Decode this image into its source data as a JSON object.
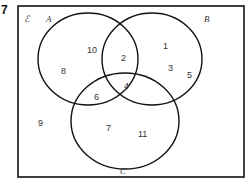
{
  "question_number": "7",
  "universal_label": "ℰ",
  "sets": {
    "A": {
      "label": "A"
    },
    "B": {
      "label": "B"
    },
    "C": {
      "label": "C"
    }
  },
  "regions": {
    "A_only": [
      "10",
      "8"
    ],
    "B_only": [
      "1",
      "3",
      "5"
    ],
    "C_only": [
      "7",
      "11"
    ],
    "A_and_B_only": [
      "2"
    ],
    "A_and_C_only": [
      "6"
    ],
    "A_and_B_and_C": [
      "4"
    ],
    "B_and_C_only": [],
    "outside": [
      "9"
    ]
  },
  "colors": {
    "stroke": "#111111",
    "text": "#333333"
  }
}
